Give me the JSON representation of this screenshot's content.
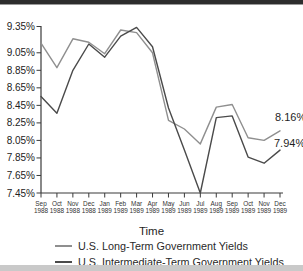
{
  "page": {
    "top_rule_color": "#2d2d2d",
    "top_rule_fringe_color": "#9a9a9a",
    "bottom_band_color": "#c9c9c9",
    "background_color": "#ffffff",
    "axis_color": "#3a3a3a",
    "tick_label_color": "#222222",
    "month_label_color": "#333333"
  },
  "chart_data": {
    "type": "line",
    "title": "",
    "xlabel": "Time",
    "ylabel": "",
    "grid": false,
    "legend_position": "bottom",
    "ylim": [
      7.45,
      9.35
    ],
    "y_tick_labels": [
      "9.35%",
      "9.05%",
      "8.85%",
      "8.65%",
      "8.45%",
      "8.25%",
      "8.05%",
      "7.85%",
      "7.65%",
      "7.45%"
    ],
    "y_tick_values": [
      9.35,
      9.05,
      8.85,
      8.65,
      8.45,
      8.25,
      8.05,
      7.85,
      7.65,
      7.45
    ],
    "categories": [
      "Sep 1988",
      "Oct 1988",
      "Nov 1988",
      "Dec 1988",
      "Jan 1989",
      "Feb 1989",
      "Mar 1989",
      "Apr 1989",
      "May 1989",
      "Jun 1989",
      "Jul 1989",
      "Aug 1989",
      "Sep 1989",
      "Oct 1989",
      "Nov 1989",
      "Dec 1989"
    ],
    "series": [
      {
        "name": "U.S. Long-Term Government Yields",
        "color": "#8f8f8f",
        "end_label": "8.16%",
        "values": [
          9.16,
          8.88,
          9.21,
          9.17,
          9.04,
          9.31,
          9.28,
          9.05,
          8.28,
          8.18,
          8.01,
          8.43,
          8.46,
          8.08,
          8.05,
          8.16
        ]
      },
      {
        "name": "U.S. Intermediate-Term Government Yields",
        "color": "#4a4a4a",
        "end_label": "7.94%",
        "values": [
          8.55,
          8.36,
          8.85,
          9.15,
          9.0,
          9.24,
          9.34,
          9.12,
          8.42,
          7.94,
          7.45,
          8.31,
          8.33,
          7.86,
          7.79,
          7.94
        ]
      }
    ]
  }
}
